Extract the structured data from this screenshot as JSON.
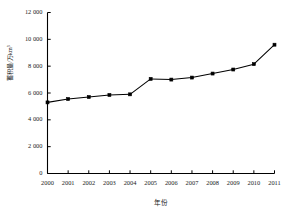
{
  "chart_data": {
    "type": "line",
    "title": "",
    "subtitle": "",
    "xlabel": "年份",
    "ylabel": "蓄积量/万km³",
    "categories": [
      "2000",
      "2001",
      "2002",
      "2003",
      "2004",
      "2005",
      "2006",
      "2007",
      "2008",
      "2009",
      "2010",
      "2011"
    ],
    "x": [
      2000,
      2001,
      2002,
      2003,
      2004,
      2005,
      2006,
      2007,
      2008,
      2009,
      2010,
      2011
    ],
    "values": [
      5300,
      5550,
      5700,
      5850,
      5900,
      7050,
      7000,
      7150,
      7450,
      7750,
      8150,
      9600
    ],
    "series": [
      {
        "name": "蓄积量",
        "values": [
          5300,
          5550,
          5700,
          5850,
          5900,
          7050,
          7000,
          7150,
          7450,
          7750,
          8150,
          9600
        ]
      }
    ],
    "xlim": [
      2000,
      2011
    ],
    "ylim": [
      0,
      12000
    ],
    "ytick_values": [
      0,
      2000,
      4000,
      6000,
      8000,
      10000,
      12000
    ],
    "ytick_labels": [
      "0",
      "2 000",
      "4 000",
      "6 000",
      "8 000",
      "10 000",
      "12 000"
    ],
    "xtick_labels": [
      "2000",
      "2001",
      "2002",
      "2003",
      "2004",
      "2005",
      "2006",
      "2007",
      "2008",
      "2009",
      "2010",
      "2011"
    ],
    "grid": false,
    "legend": false,
    "legend_position": "none",
    "line_color": "#000000",
    "marker_color": "#000000",
    "marker_shape": "square",
    "background_color": "#ffffff",
    "axis_color": "#000000"
  }
}
